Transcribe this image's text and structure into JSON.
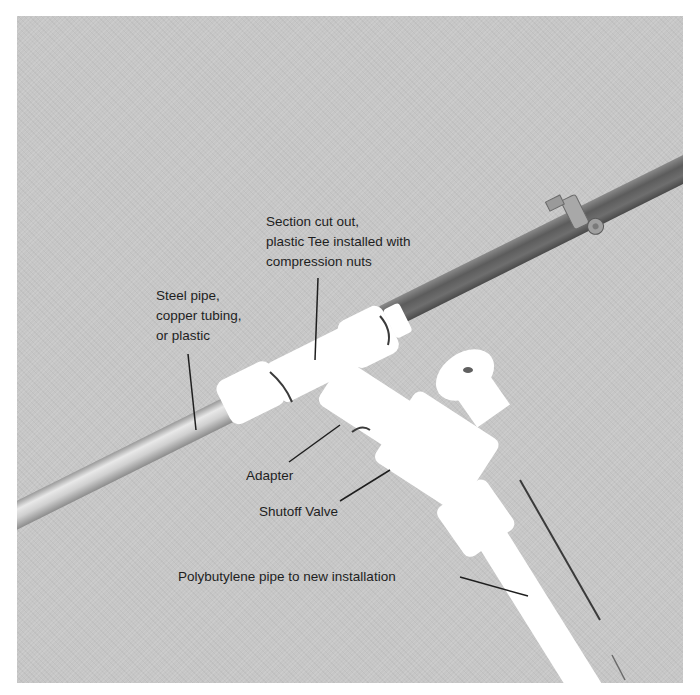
{
  "figure": {
    "colors": {
      "background": "#c6c6c6",
      "steel_pipe_dark": "#6a6a6a",
      "left_pipe_light": "#dcdcdc",
      "plastic_fittings": "#ffffff",
      "label_text": "#1e1e1e",
      "leader_line": "#1e1e1e"
    },
    "callouts": {
      "steel_pipe": {
        "lines": [
          "Steel pipe,",
          "copper tubing,",
          "or plastic"
        ]
      },
      "section_cut": {
        "lines": [
          "Section cut out,",
          "plastic Tee installed with",
          "compression nuts"
        ]
      },
      "adapter": {
        "text": "Adapter"
      },
      "shutoff_valve": {
        "text": "Shutoff Valve"
      },
      "polybutylene": {
        "text": "Polybutylene pipe to new installation"
      }
    }
  }
}
